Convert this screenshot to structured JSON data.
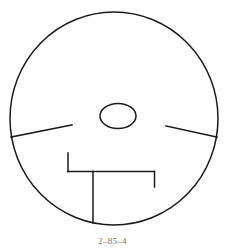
{
  "diagram": {
    "caption": "2‒85‒4",
    "stroke_color": "#1a1a1a",
    "stroke_width": 1.5,
    "outer_circle": {
      "cx": 114,
      "cy": 118.5,
      "rx": 104,
      "ry": 106.5
    },
    "center_ellipse": {
      "cx": 118,
      "cy": 116,
      "rx": 18,
      "ry": 12.5
    },
    "lines": [
      {
        "name": "left-radial-line",
        "x1": 11,
        "y1": 137,
        "x2": 72,
        "y2": 125
      },
      {
        "name": "right-radial-line",
        "x1": 166,
        "y1": 126,
        "x2": 217,
        "y2": 137
      },
      {
        "name": "left-short-vertical",
        "x1": 68,
        "y1": 153,
        "x2": 68,
        "y2": 171.5
      },
      {
        "name": "horizontal-bar",
        "x1": 68,
        "y1": 171.5,
        "x2": 154.5,
        "y2": 171.5
      },
      {
        "name": "right-short-vertical",
        "x1": 154.5,
        "y1": 171.5,
        "x2": 154.5,
        "y2": 187
      },
      {
        "name": "long-vertical",
        "x1": 93,
        "y1": 171.5,
        "x2": 93,
        "y2": 223
      }
    ]
  }
}
